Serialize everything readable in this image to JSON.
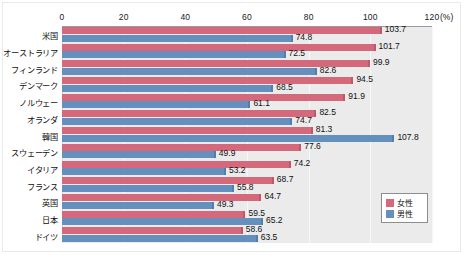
{
  "chart_data": {
    "type": "bar",
    "orientation": "horizontal",
    "title": "",
    "subtitle": "",
    "xlabel": "(%)",
    "ylabel": "",
    "xlim": [
      0,
      120
    ],
    "xticks": [
      0,
      20,
      40,
      60,
      80,
      100,
      120
    ],
    "xtick_labels": [
      "0",
      "20",
      "40",
      "60",
      "80",
      "100",
      "120"
    ],
    "unit_label": "(%)",
    "grid": true,
    "grid_axis": "x",
    "legend_position": "bottom-right",
    "categories": [
      "米国",
      "オーストラリア",
      "フィンランド",
      "デンマーク",
      "ノルウェー",
      "オランダ",
      "韓国",
      "スウェーデン",
      "イタリア",
      "フランス",
      "英国",
      "日本",
      "ドイツ"
    ],
    "series": [
      {
        "name": "女性",
        "color": "#d4697c",
        "values": [
          103.7,
          101.7,
          99.9,
          94.5,
          91.9,
          82.5,
          81.3,
          77.6,
          74.2,
          68.7,
          64.7,
          59.5,
          58.6
        ]
      },
      {
        "name": "男性",
        "color": "#6590bd",
        "values": [
          74.8,
          72.5,
          82.6,
          68.5,
          61.1,
          74.7,
          107.8,
          49.9,
          53.2,
          55.8,
          49.3,
          65.2,
          63.5
        ]
      }
    ]
  },
  "legend": {
    "items": [
      {
        "label": "女性",
        "color": "#d4697c"
      },
      {
        "label": "男性",
        "color": "#6590bd"
      }
    ]
  },
  "colors": {
    "female": "#d4697c",
    "male": "#6590bd",
    "plot_background": "#ebebeb",
    "page_background": "#ffffff",
    "gridline": "#f7f7f7",
    "text": "#111111"
  }
}
